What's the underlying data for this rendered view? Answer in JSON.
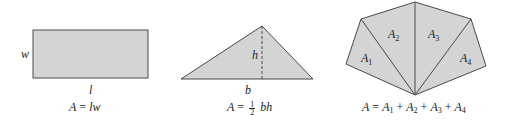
{
  "figures": [
    {
      "name": "rectangle",
      "labels": {
        "width": "w",
        "length": "l"
      },
      "formula": {
        "lhs": "A",
        "eq": "=",
        "rhs": "lw"
      }
    },
    {
      "name": "triangle",
      "labels": {
        "height": "h",
        "base": "b"
      },
      "formula": {
        "lhs": "A",
        "eq": "=",
        "num": "1",
        "den": "2",
        "rhs": "bh"
      }
    },
    {
      "name": "polygon",
      "regions": [
        {
          "label": "A",
          "sub": "1"
        },
        {
          "label": "A",
          "sub": "2"
        },
        {
          "label": "A",
          "sub": "3"
        },
        {
          "label": "A",
          "sub": "4"
        }
      ],
      "formula": {
        "lhs": "A",
        "eq": "=",
        "plus": "+"
      }
    }
  ],
  "colors": {
    "fill": "#d4d4d4",
    "stroke": "#4a4a4a"
  }
}
